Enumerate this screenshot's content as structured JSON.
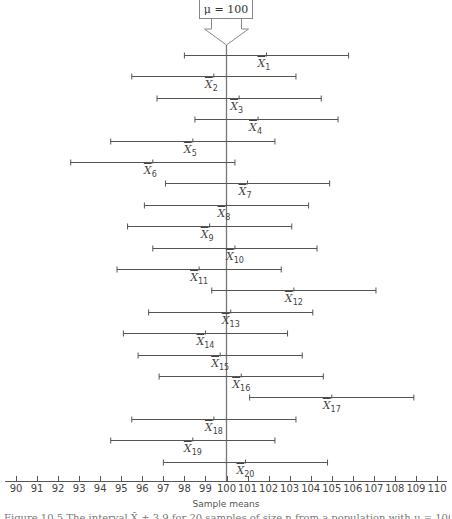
{
  "chart_data": {
    "type": "interval",
    "title": "",
    "reference_label": "μ = 100",
    "reference_value": 100,
    "xlabel": "Sample means",
    "xlim": [
      90,
      110
    ],
    "xticks": [
      90,
      91,
      92,
      93,
      94,
      95,
      96,
      97,
      98,
      99,
      100,
      101,
      102,
      103,
      104,
      105,
      106,
      107,
      108,
      109,
      110
    ],
    "half_width": 3.9,
    "intervals": [
      {
        "label": "X̄",
        "sub": "1",
        "mean": 101.9,
        "lower": 98.0,
        "upper": 105.8
      },
      {
        "label": "X̄",
        "sub": "2",
        "mean": 99.4,
        "lower": 95.5,
        "upper": 103.3
      },
      {
        "label": "X̄",
        "sub": "3",
        "mean": 100.6,
        "lower": 96.7,
        "upper": 104.5
      },
      {
        "label": "X̄",
        "sub": "4",
        "mean": 101.5,
        "lower": 98.5,
        "upper": 105.3
      },
      {
        "label": "X̄",
        "sub": "5",
        "mean": 98.4,
        "lower": 94.5,
        "upper": 102.3
      },
      {
        "label": "X̄",
        "sub": "6",
        "mean": 96.5,
        "lower": 92.6,
        "upper": 100.4
      },
      {
        "label": "X̄",
        "sub": "7",
        "mean": 101.0,
        "lower": 97.1,
        "upper": 104.9
      },
      {
        "label": "X̄",
        "sub": "8",
        "mean": 100.0,
        "lower": 96.1,
        "upper": 103.9
      },
      {
        "label": "X̄",
        "sub": "9",
        "mean": 99.2,
        "lower": 95.3,
        "upper": 103.1
      },
      {
        "label": "X̄",
        "sub": "10",
        "mean": 100.4,
        "lower": 96.5,
        "upper": 104.3
      },
      {
        "label": "X̄",
        "sub": "11",
        "mean": 98.7,
        "lower": 94.8,
        "upper": 102.6
      },
      {
        "label": "X̄",
        "sub": "12",
        "mean": 103.2,
        "lower": 99.3,
        "upper": 107.1
      },
      {
        "label": "X̄",
        "sub": "13",
        "mean": 100.2,
        "lower": 96.3,
        "upper": 104.1
      },
      {
        "label": "X̄",
        "sub": "14",
        "mean": 99.0,
        "lower": 95.1,
        "upper": 102.9
      },
      {
        "label": "X̄",
        "sub": "15",
        "mean": 99.7,
        "lower": 95.8,
        "upper": 103.6
      },
      {
        "label": "X̄",
        "sub": "16",
        "mean": 100.7,
        "lower": 96.8,
        "upper": 104.6
      },
      {
        "label": "X̄",
        "sub": "17",
        "mean": 105.0,
        "lower": 101.1,
        "upper": 108.9
      },
      {
        "label": "X̄",
        "sub": "18",
        "mean": 99.4,
        "lower": 95.5,
        "upper": 103.3
      },
      {
        "label": "X̄",
        "sub": "19",
        "mean": 98.4,
        "lower": 94.5,
        "upper": 102.3
      },
      {
        "label": "X̄",
        "sub": "20",
        "mean": 100.9,
        "lower": 97.0,
        "upper": 104.8
      }
    ]
  },
  "figure": {
    "mu_label": "μ = 100",
    "axis_title": "Sample means",
    "caption": "Figure 10.5  The interval X̄ ± 3.9 for 20 samples of size n from a population with μ = 100."
  }
}
